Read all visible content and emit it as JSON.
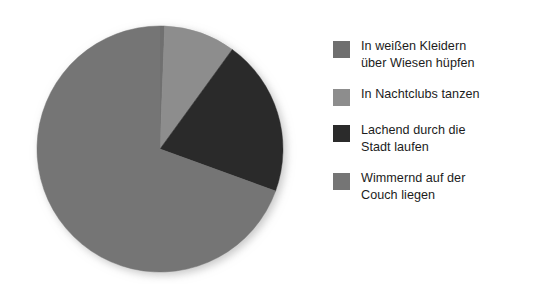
{
  "chart_data": {
    "type": "pie",
    "title": "",
    "subtitle": "",
    "xlabel": "",
    "ylabel": "",
    "grid": false,
    "legend_position": "right",
    "categories": [
      "In weißen Kleidern über Wiesen hüpfen",
      "In Nachtclubs tanzen",
      "Lachend durch die Stadt laufen",
      "Wimmernd auf der Couch liegen"
    ],
    "values": [
      0.6,
      9.4,
      20.5,
      69.5
    ],
    "unit": "percent",
    "colors": [
      "#6f6f6f",
      "#8d8d8d",
      "#2b2b2b",
      "#757575"
    ],
    "start_angle_deg": 0,
    "direction": "clockwise",
    "slices": [
      {
        "label": "In weißen Kleidern über Wiesen hüpfen",
        "value": 0.6,
        "start_deg": 0,
        "end_deg": 2.2,
        "color": "#6f6f6f"
      },
      {
        "label": "In Nachtclubs tanzen",
        "value": 9.4,
        "start_deg": 2.2,
        "end_deg": 36.0,
        "color": "#8d8d8d"
      },
      {
        "label": "Lachend durch die Stadt laufen",
        "value": 20.5,
        "start_deg": 36.0,
        "end_deg": 110.0,
        "color": "#2b2b2b"
      },
      {
        "label": "Wimmernd auf der Couch liegen",
        "value": 69.5,
        "start_deg": 110.0,
        "end_deg": 360.0,
        "color": "#757575"
      }
    ]
  },
  "legend": {
    "items": [
      {
        "label": "In weißen Kleidern\nüber Wiesen hüpfen",
        "color": "#6f6f6f"
      },
      {
        "label": "In Nachtclubs tanzen",
        "color": "#8d8d8d"
      },
      {
        "label": "Lachend durch die\nStadt laufen",
        "color": "#2b2b2b"
      },
      {
        "label": "Wimmernd auf der\nCouch liegen",
        "color": "#757575"
      }
    ]
  },
  "colors": {
    "background": "#ffffff",
    "text": "#1c1c1c",
    "slice_light": "#8d8d8d",
    "slice_dark": "#2b2b2b",
    "slice_main": "#757575",
    "slice_sliver": "#6f6f6f"
  }
}
